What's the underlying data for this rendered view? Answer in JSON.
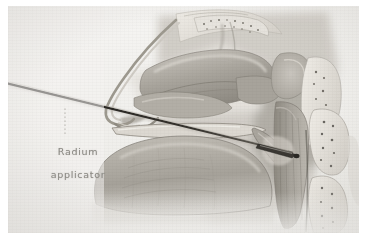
{
  "figure": {
    "kind": "anatomical-illustration",
    "view": "midsagittal section of head and neck",
    "medium": "halftone wash drawing, grayscale",
    "background_color": "#f2f1ef",
    "border_color": "#ffffff",
    "width": 368,
    "height": 244
  },
  "annotations": {
    "applicator_label": {
      "line1": "Radium",
      "line2": "applicator",
      "color": "#8d8b86",
      "x": 28,
      "y": 128
    }
  },
  "leader_line": {
    "style": "dotted",
    "color": "#b4b1ab",
    "from_x": 57,
    "from_y": 128,
    "to_x": 57,
    "to_y": 100
  },
  "instrument": {
    "name": "radium applicator",
    "shape": "thin straight rod with tapered tip",
    "color": "#2a2824",
    "entry_x": 8,
    "entry_y": 84,
    "tip_x": 292,
    "tip_y": 151,
    "insertion_route": "through nostril into nasopharynx"
  },
  "structures": [
    {
      "name": "frontal-bone",
      "label": "frontal bone"
    },
    {
      "name": "cribriform-plate",
      "label": "cribriform plate"
    },
    {
      "name": "nasal-dorsum",
      "label": "nasal dorsum"
    },
    {
      "name": "nasal-tip",
      "label": "nasal tip"
    },
    {
      "name": "nasal-turbinates",
      "label": "nasal turbinates"
    },
    {
      "name": "sphenoid-sinus",
      "label": "sphenoid sinus"
    },
    {
      "name": "hard-palate",
      "label": "hard palate"
    },
    {
      "name": "soft-palate",
      "label": "soft palate"
    },
    {
      "name": "tongue",
      "label": "tongue"
    },
    {
      "name": "nasopharynx",
      "label": "nasopharynx"
    },
    {
      "name": "posterior-pharyngeal-wall",
      "label": "posterior pharyngeal wall"
    },
    {
      "name": "cervical-vertebrae",
      "label": "cervical vertebrae"
    }
  ],
  "palette": {
    "paper": "#f2f1ef",
    "tissue_light": "#d8d5cf",
    "tissue_mid": "#b9b5ad",
    "tissue_dark": "#8e8a82",
    "shadow": "#6e6a63",
    "bone": "#e6e3dd",
    "stipple": "#5d5a54",
    "instrument": "#2a2824",
    "label_text": "#8d8b86"
  }
}
